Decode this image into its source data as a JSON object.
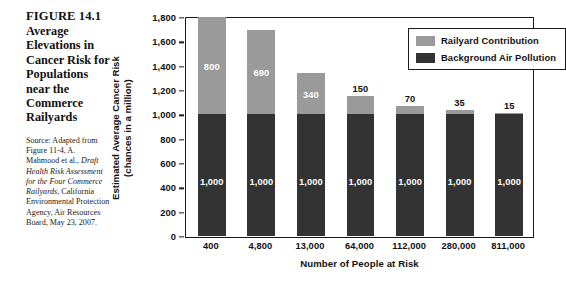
{
  "figure": {
    "number": "FIGURE 14.1",
    "title": "Average Elevations in Cancer Risk for Populations near the Commerce Railyards",
    "source_intro": "Source: Adapted from Figure 11-4, A. Mahmood et al., ",
    "source_italic": "Draft Health Risk Assessment for the Four Commerce Railyards",
    "source_rest": ", California Environmental Protection Agency, Air Resources Board, May 23, 2007."
  },
  "chart_data": {
    "type": "bar",
    "stacked": true,
    "title": "Average Elevations in Cancer Risk for Populations near the Commerce Railyards",
    "xlabel": "Number of People at Risk",
    "ylabel": "Estimated Average Cancer Risk (chances in a million)",
    "ylabel_line1": "Estimated Average Cancer Risk",
    "ylabel_line2": "(chances in a million)",
    "categories": [
      "400",
      "4,800",
      "13,000",
      "64,000",
      "112,000",
      "280,000",
      "811,000"
    ],
    "series": [
      {
        "name": "Background Air Pollution",
        "color": "#333333",
        "values": [
          1000,
          1000,
          1000,
          1000,
          1000,
          1000,
          1000
        ],
        "labels": [
          "1,000",
          "1,000",
          "1,000",
          "1,000",
          "1,000",
          "1,000",
          "1,000"
        ],
        "label_color": "#ffffff"
      },
      {
        "name": "Railyard Contribution",
        "color": "#9a9a9a",
        "values": [
          800,
          690,
          340,
          150,
          70,
          35,
          15
        ],
        "labels": [
          "800",
          "690",
          "340",
          "150",
          "70",
          "35",
          "15"
        ],
        "label_color": "#ffffff"
      }
    ],
    "totals": [
      1800,
      1690,
      1340,
      1150,
      1070,
      1035,
      1015
    ],
    "ylim": [
      0,
      1800
    ],
    "ytick_step": 200,
    "yticks": [
      "0",
      "200",
      "400",
      "600",
      "800",
      "1,000",
      "1,200",
      "1,400",
      "1,600",
      "1,800"
    ],
    "ytick_values": [
      0,
      200,
      400,
      600,
      800,
      1000,
      1200,
      1400,
      1600,
      1800
    ],
    "grid": false,
    "legend_position": "top-right",
    "legend": [
      {
        "label": "Railyard Contribution",
        "color": "#9a9a9a"
      },
      {
        "label": "Background Air Pollution",
        "color": "#333333"
      }
    ]
  }
}
